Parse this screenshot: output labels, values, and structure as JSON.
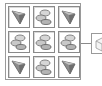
{
  "recipe": {
    "grid": [
      [
        "wedge",
        "rock",
        "wedge"
      ],
      [
        "rock",
        "rock",
        "rock"
      ],
      [
        "wedge",
        "rock",
        "wedge"
      ]
    ],
    "output": "cube"
  },
  "icons": {
    "wedge": "stone-wedge-icon",
    "rock": "rock-pile-icon",
    "cube": "block-icon"
  }
}
